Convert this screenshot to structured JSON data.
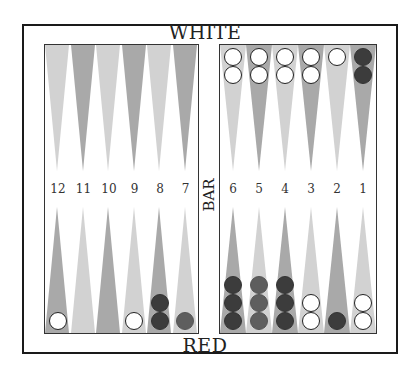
{
  "labels": {
    "top": "WHITE",
    "bottom": "RED",
    "bar": "BAR"
  },
  "colors": {
    "light_point": "#d2d2d2",
    "dark_point": "#a9a9a9",
    "white_checker": "#ffffff",
    "red_checker": "#3c3c3c",
    "red_checker_light": "#5e5e5e"
  },
  "point_numbers": {
    "left": [
      "12",
      "11",
      "10",
      "9",
      "8",
      "7"
    ],
    "right": [
      "6",
      "5",
      "4",
      "3",
      "2",
      "1"
    ]
  },
  "top_points": {
    "left": [
      {
        "shade": "light",
        "checkers": []
      },
      {
        "shade": "dark",
        "checkers": []
      },
      {
        "shade": "light",
        "checkers": []
      },
      {
        "shade": "dark",
        "checkers": []
      },
      {
        "shade": "light",
        "checkers": []
      },
      {
        "shade": "dark",
        "checkers": []
      }
    ],
    "right": [
      {
        "point": "6",
        "shade": "light",
        "checkers": [
          "white",
          "white"
        ]
      },
      {
        "point": "5",
        "shade": "dark",
        "checkers": [
          "white",
          "white"
        ]
      },
      {
        "point": "4",
        "shade": "light",
        "checkers": [
          "white",
          "white"
        ]
      },
      {
        "point": "3",
        "shade": "dark",
        "checkers": [
          "white",
          "white"
        ]
      },
      {
        "point": "2",
        "shade": "light",
        "checkers": [
          "white"
        ]
      },
      {
        "point": "1",
        "shade": "dark",
        "checkers": [
          "red",
          "red"
        ]
      }
    ]
  },
  "bottom_points": {
    "left": [
      {
        "shade": "dark",
        "checkers": [
          "white"
        ]
      },
      {
        "shade": "light",
        "checkers": []
      },
      {
        "shade": "dark",
        "checkers": []
      },
      {
        "shade": "light",
        "checkers": [
          "white"
        ]
      },
      {
        "shade": "dark",
        "checkers": [
          "red",
          "red"
        ]
      },
      {
        "shade": "light",
        "checkers": [
          "red-light"
        ]
      }
    ],
    "right": [
      {
        "shade": "dark",
        "checkers": [
          "red",
          "red",
          "red"
        ]
      },
      {
        "shade": "light",
        "checkers": [
          "red-light",
          "red-light",
          "red-light"
        ]
      },
      {
        "shade": "dark",
        "checkers": [
          "red",
          "red",
          "red"
        ]
      },
      {
        "shade": "light",
        "checkers": [
          "white",
          "white"
        ]
      },
      {
        "shade": "dark",
        "checkers": [
          "red"
        ]
      },
      {
        "shade": "light",
        "checkers": [
          "white",
          "white"
        ]
      }
    ]
  }
}
